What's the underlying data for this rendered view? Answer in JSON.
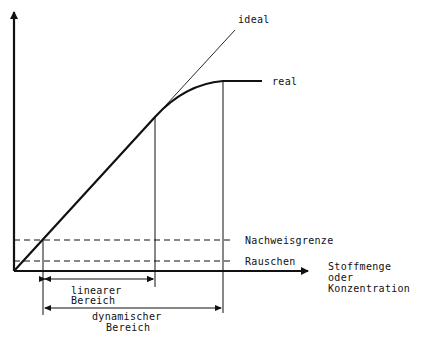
{
  "diagram": {
    "curve_labels": {
      "ideal": "ideal",
      "real": "real"
    },
    "threshold_labels": {
      "detection_limit": "Nachweisgrenze",
      "noise": "Rauschen"
    },
    "x_axis_label": {
      "line1": "Stoffmenge",
      "line2": "oder",
      "line3": "Konzentration"
    },
    "ranges": {
      "linear": {
        "line1": "linearer",
        "line2": "Bereich"
      },
      "dynamic": {
        "line1": "dynamischer",
        "line2": "Bereich"
      }
    },
    "colors": {
      "ink": "#111111",
      "background": "#ffffff"
    }
  }
}
